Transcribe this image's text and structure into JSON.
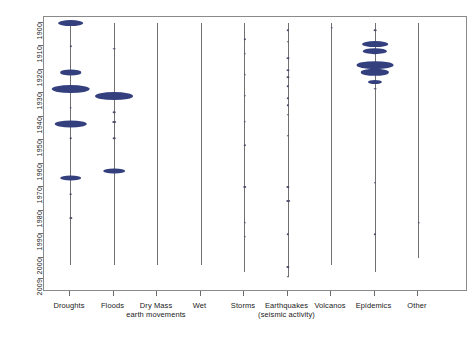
{
  "chart_data": {
    "type": "scatter",
    "title": "",
    "subtitle": "",
    "xlabel": "",
    "ylabel": "",
    "orientation": "vertical-strip-violin",
    "grid": false,
    "legend": "none",
    "accent_color": "#34407e",
    "line_color": "#707070",
    "axis_color": "#6b6b6b",
    "ylim": [
      1900,
      2009
    ],
    "y_inverted": true,
    "ytick_labels": [
      "1900",
      "1910",
      "1920",
      "1930",
      "1940",
      "1950",
      "1960",
      "1970",
      "1980",
      "1990",
      "2000",
      "2009"
    ],
    "ytick_values": [
      1900,
      1910,
      1920,
      1930,
      1940,
      1950,
      1960,
      1970,
      1980,
      1990,
      2000,
      2009
    ],
    "categories": [
      "Droughts",
      "Floods",
      "Dry Mass",
      "Wet",
      "Storms",
      "Earthquakes",
      "Volcanos",
      "Epidemics",
      "Other"
    ],
    "category_sublabels": [
      "",
      "",
      "earth movements",
      "",
      "",
      "(seismic activity)",
      "",
      "",
      ""
    ],
    "series": [
      {
        "name": "Droughts",
        "line_span": [
          1900,
          2003
        ],
        "markers": [
          {
            "year": 1900,
            "magnitude": 0.52,
            "kind": "violin"
          },
          {
            "year": 1910,
            "magnitude": 0.06,
            "kind": "dot"
          },
          {
            "year": 1921,
            "magnitude": 0.4,
            "kind": "violin"
          },
          {
            "year": 1928,
            "magnitude": 0.9,
            "kind": "violin"
          },
          {
            "year": 1936,
            "magnitude": 0.08,
            "kind": "dot"
          },
          {
            "year": 1943,
            "magnitude": 0.72,
            "kind": "violin"
          },
          {
            "year": 1949,
            "magnitude": 0.07,
            "kind": "dot"
          },
          {
            "year": 1966,
            "magnitude": 0.4,
            "kind": "violin"
          },
          {
            "year": 1973,
            "magnitude": 0.08,
            "kind": "dot"
          },
          {
            "year": 1983,
            "magnitude": 0.12,
            "kind": "dot"
          }
        ]
      },
      {
        "name": "Floods",
        "line_span": [
          1900,
          2003
        ],
        "markers": [
          {
            "year": 1911,
            "magnitude": 0.08,
            "kind": "dot"
          },
          {
            "year": 1931,
            "magnitude": 0.88,
            "kind": "violin"
          },
          {
            "year": 1938,
            "magnitude": 0.07,
            "kind": "dot"
          },
          {
            "year": 1942,
            "magnitude": 0.14,
            "kind": "dot"
          },
          {
            "year": 1949,
            "magnitude": 0.07,
            "kind": "dot"
          },
          {
            "year": 1963,
            "magnitude": 0.4,
            "kind": "violin"
          }
        ]
      },
      {
        "name": "Dry Mass",
        "line_span": [
          1900,
          2003
        ],
        "markers": []
      },
      {
        "name": "Wet",
        "line_span": [
          1900,
          2003
        ],
        "markers": []
      },
      {
        "name": "Storms",
        "line_span": [
          1900,
          2006
        ],
        "markers": [
          {
            "year": 1907,
            "magnitude": 0.05,
            "kind": "dot"
          },
          {
            "year": 1913,
            "magnitude": 0.05,
            "kind": "dot"
          },
          {
            "year": 1922,
            "magnitude": 0.05,
            "kind": "dot"
          },
          {
            "year": 1931,
            "magnitude": 0.05,
            "kind": "dot"
          },
          {
            "year": 1942,
            "magnitude": 0.05,
            "kind": "dot"
          },
          {
            "year": 1952,
            "magnitude": 0.05,
            "kind": "dot"
          },
          {
            "year": 1970,
            "magnitude": 0.14,
            "kind": "dot"
          },
          {
            "year": 1985,
            "magnitude": 0.05,
            "kind": "dot"
          },
          {
            "year": 1991,
            "magnitude": 0.05,
            "kind": "dot"
          }
        ]
      },
      {
        "name": "Earthquakes",
        "line_span": [
          1900,
          2008
        ],
        "markers": [
          {
            "year": 1903,
            "magnitude": 0.06,
            "kind": "dot"
          },
          {
            "year": 1908,
            "magnitude": 0.06,
            "kind": "dot"
          },
          {
            "year": 1915,
            "magnitude": 0.1,
            "kind": "dot"
          },
          {
            "year": 1920,
            "magnitude": 0.1,
            "kind": "dot"
          },
          {
            "year": 1923,
            "magnitude": 0.1,
            "kind": "dot"
          },
          {
            "year": 1927,
            "magnitude": 0.06,
            "kind": "dot"
          },
          {
            "year": 1932,
            "magnitude": 0.05,
            "kind": "dot"
          },
          {
            "year": 1935,
            "magnitude": 0.05,
            "kind": "dot"
          },
          {
            "year": 1939,
            "magnitude": 0.06,
            "kind": "dot"
          },
          {
            "year": 1948,
            "magnitude": 0.05,
            "kind": "dot"
          },
          {
            "year": 1970,
            "magnitude": 0.12,
            "kind": "dot"
          },
          {
            "year": 1976,
            "magnitude": 0.14,
            "kind": "dot"
          },
          {
            "year": 1990,
            "magnitude": 0.06,
            "kind": "dot"
          },
          {
            "year": 2004,
            "magnitude": 0.12,
            "kind": "dot"
          },
          {
            "year": 2008,
            "magnitude": 0.06,
            "kind": "dot"
          }
        ]
      },
      {
        "name": "Volcanos",
        "line_span": [
          1900,
          2003
        ],
        "markers": [
          {
            "year": 1902,
            "magnitude": 0.06,
            "kind": "dot"
          }
        ]
      },
      {
        "name": "Epidemics",
        "line_span": [
          1900,
          2006
        ],
        "markers": [
          {
            "year": 1903,
            "magnitude": 0.08,
            "kind": "dot"
          },
          {
            "year": 1909,
            "magnitude": 0.52,
            "kind": "violin"
          },
          {
            "year": 1912,
            "magnitude": 0.48,
            "kind": "violin"
          },
          {
            "year": 1918,
            "magnitude": 0.85,
            "kind": "violin"
          },
          {
            "year": 1921,
            "magnitude": 0.6,
            "kind": "violin"
          },
          {
            "year": 1925,
            "magnitude": 0.18,
            "kind": "violin"
          },
          {
            "year": 1928,
            "magnitude": 0.08,
            "kind": "dot"
          },
          {
            "year": 1968,
            "magnitude": 0.05,
            "kind": "dot"
          },
          {
            "year": 1990,
            "magnitude": 0.05,
            "kind": "dot"
          }
        ]
      },
      {
        "name": "Other",
        "line_span": [
          1900,
          2000
        ],
        "markers": [
          {
            "year": 1985,
            "magnitude": 0.06,
            "kind": "dot"
          }
        ]
      }
    ]
  },
  "caption": {
    "text": ""
  }
}
